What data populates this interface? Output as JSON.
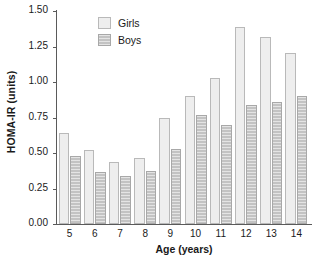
{
  "chart_data": {
    "type": "bar",
    "title": "",
    "xlabel": "Age (years)",
    "ylabel": "HOMA-IR (units)",
    "categories": [
      "5",
      "6",
      "7",
      "8",
      "9",
      "10",
      "11",
      "12",
      "13",
      "14"
    ],
    "series": [
      {
        "name": "Girls",
        "color": "#eeeeee",
        "values": [
          0.64,
          0.52,
          0.435,
          0.465,
          0.745,
          0.905,
          1.025,
          1.39,
          1.315,
          1.205
        ]
      },
      {
        "name": "Boys",
        "color": "#c3c3c3",
        "values": [
          0.48,
          0.365,
          0.335,
          0.375,
          0.525,
          0.765,
          0.7,
          0.835,
          0.86,
          0.905
        ]
      }
    ],
    "ylim": [
      0.0,
      1.5
    ],
    "yticks": [
      "0.00",
      "0.25",
      "0.50",
      "0.75",
      "1.00",
      "1.25",
      "1.50"
    ],
    "ytick_values": [
      0.0,
      0.25,
      0.5,
      0.75,
      1.0,
      1.25,
      1.5
    ],
    "grid": false,
    "legend_position": "top-left-inside"
  }
}
